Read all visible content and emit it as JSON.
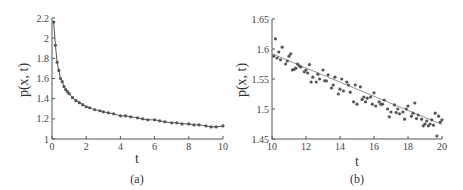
{
  "chart_data": [
    {
      "type": "scatter",
      "caption": "(a)",
      "title": "",
      "xlabel": "t",
      "ylabel": "p(x, t)",
      "xlim": [
        0,
        10
      ],
      "ylim": [
        1,
        2.2
      ],
      "xticks": [
        "0",
        "2",
        "4",
        "6",
        "8",
        "10"
      ],
      "yticks": [
        "1",
        "1.2",
        "1.4",
        "1.6",
        "1.8",
        "2",
        "2.2"
      ],
      "grid": false,
      "series": [
        {
          "name": "data",
          "style": "markers+line",
          "x": [
            0.1,
            0.2,
            0.3,
            0.4,
            0.5,
            0.6,
            0.7,
            0.8,
            0.9,
            1.0,
            1.2,
            1.4,
            1.6,
            1.8,
            2.0,
            2.2,
            2.5,
            2.8,
            3.0,
            3.3,
            3.6,
            4.0,
            4.3,
            4.6,
            5.0,
            5.3,
            5.6,
            6.0,
            6.3,
            6.6,
            7.0,
            7.3,
            7.6,
            8.0,
            8.3,
            8.6,
            9.0,
            9.3,
            9.6,
            10.0
          ],
          "y": [
            2.16,
            1.93,
            1.76,
            1.68,
            1.6,
            1.57,
            1.52,
            1.49,
            1.47,
            1.45,
            1.41,
            1.38,
            1.36,
            1.34,
            1.32,
            1.31,
            1.29,
            1.28,
            1.27,
            1.26,
            1.25,
            1.23,
            1.23,
            1.22,
            1.21,
            1.2,
            1.19,
            1.19,
            1.18,
            1.17,
            1.16,
            1.16,
            1.15,
            1.15,
            1.14,
            1.14,
            1.13,
            1.12,
            1.12,
            1.13
          ]
        }
      ]
    },
    {
      "type": "scatter",
      "caption": "(b)",
      "title": "",
      "xlabel": "t",
      "ylabel": "p(x, t)",
      "xlim": [
        10,
        20
      ],
      "ylim": [
        1.45,
        1.65
      ],
      "xticks": [
        "10",
        "12",
        "14",
        "16",
        "18",
        "20"
      ],
      "yticks": [
        "1.45",
        "1.5",
        "1.55",
        "1.6",
        "1.65"
      ],
      "grid": false,
      "fit_line": {
        "x": [
          10,
          20
        ],
        "y": [
          1.592,
          1.474
        ]
      },
      "series": [
        {
          "name": "data",
          "style": "markers",
          "x": [
            10.1,
            10.2,
            10.3,
            10.4,
            10.5,
            10.6,
            10.8,
            10.9,
            11.0,
            11.1,
            11.2,
            11.3,
            11.4,
            11.5,
            11.6,
            11.7,
            11.9,
            12.0,
            12.1,
            12.2,
            12.3,
            12.4,
            12.6,
            12.7,
            12.8,
            13.0,
            13.1,
            13.2,
            13.3,
            13.5,
            13.6,
            13.7,
            13.9,
            14.0,
            14.1,
            14.2,
            14.4,
            14.5,
            14.6,
            14.8,
            14.9,
            15.0,
            15.2,
            15.3,
            15.4,
            15.5,
            15.6,
            15.8,
            15.9,
            16.0,
            16.1,
            16.3,
            16.4,
            16.5,
            16.6,
            16.8,
            16.9,
            17.0,
            17.2,
            17.3,
            17.4,
            17.5,
            17.7,
            17.8,
            17.9,
            18.0,
            18.2,
            18.3,
            18.4,
            18.5,
            18.6,
            18.8,
            18.9,
            19.0,
            19.1,
            19.2,
            19.3,
            19.4,
            19.5,
            19.6,
            19.7,
            19.8,
            19.9,
            20.0
          ],
          "y": [
            1.588,
            1.617,
            1.585,
            1.595,
            1.582,
            1.603,
            1.575,
            1.58,
            1.588,
            1.592,
            1.565,
            1.566,
            1.568,
            1.575,
            1.572,
            1.57,
            1.562,
            1.565,
            1.56,
            1.574,
            1.545,
            1.553,
            1.545,
            1.558,
            1.55,
            1.565,
            1.547,
            1.547,
            1.557,
            1.535,
            1.54,
            1.553,
            1.525,
            1.533,
            1.55,
            1.53,
            1.545,
            1.54,
            1.528,
            1.512,
            1.54,
            1.508,
            1.537,
            1.516,
            1.52,
            1.512,
            1.518,
            1.52,
            1.508,
            1.527,
            1.505,
            1.512,
            1.508,
            1.508,
            1.515,
            1.5,
            1.487,
            1.495,
            1.507,
            1.494,
            1.5,
            1.492,
            1.495,
            1.483,
            1.5,
            1.505,
            1.488,
            1.493,
            1.51,
            1.484,
            1.49,
            1.483,
            1.472,
            1.475,
            1.48,
            1.472,
            1.475,
            1.482,
            1.473,
            1.493,
            1.455,
            1.488,
            1.478,
            1.482
          ]
        }
      ]
    }
  ]
}
